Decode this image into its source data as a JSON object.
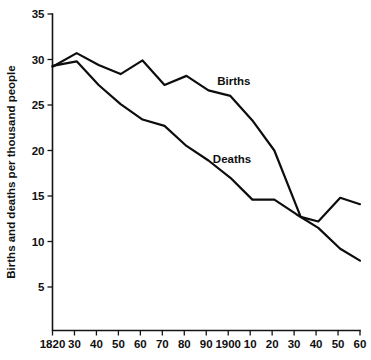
{
  "chart_data": {
    "type": "line",
    "title": "",
    "subtitle": "",
    "xlabel": "",
    "ylabel": "Births and deaths per thousand people",
    "xlim": [
      1820,
      1960
    ],
    "ylim": [
      0,
      35
    ],
    "grid": false,
    "legend_position": "inline-annotation",
    "x_tick_labels": [
      "1820",
      "30",
      "40",
      "50",
      "60",
      "70",
      "80",
      "90",
      "1900",
      "10",
      "20",
      "30",
      "40",
      "50",
      "60"
    ],
    "x_tick_values": [
      1820,
      1830,
      1840,
      1850,
      1860,
      1870,
      1880,
      1890,
      1900,
      1910,
      1920,
      1930,
      1940,
      1950,
      1960
    ],
    "y_tick_labels": [
      "5",
      "10",
      "15",
      "20",
      "25",
      "30",
      "35"
    ],
    "y_tick_values": [
      5,
      10,
      15,
      20,
      25,
      30,
      35
    ],
    "annotations": [
      {
        "text": "Births",
        "x": 1895,
        "y": 27.2
      },
      {
        "text": "Deaths",
        "x": 1893,
        "y": 18.6
      }
    ],
    "series": [
      {
        "name": "Births",
        "color": "#0d0d0d",
        "x": [
          1820,
          1831,
          1841,
          1851,
          1861,
          1871,
          1881,
          1891,
          1901,
          1911,
          1921,
          1933,
          1941,
          1951,
          1960
        ],
        "values": [
          29.2,
          30.7,
          29.4,
          28.4,
          29.9,
          27.2,
          28.2,
          26.6,
          26.0,
          23.3,
          20.0,
          12.7,
          12.2,
          14.8,
          14.1
        ]
      },
      {
        "name": "Deaths",
        "color": "#0d0d0d",
        "x": [
          1820,
          1831,
          1841,
          1851,
          1861,
          1871,
          1881,
          1891,
          1901,
          1911,
          1921,
          1931,
          1941,
          1951,
          1960
        ],
        "values": [
          29.3,
          29.8,
          27.2,
          25.1,
          23.4,
          22.7,
          20.5,
          18.9,
          17.0,
          14.6,
          14.6,
          13.0,
          11.5,
          9.2,
          7.9
        ]
      }
    ]
  }
}
